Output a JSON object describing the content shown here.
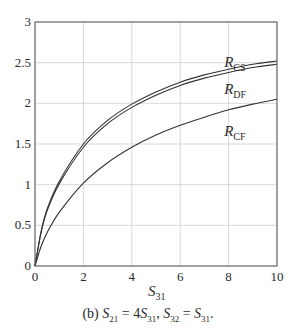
{
  "chart_data": {
    "type": "line",
    "title": "",
    "xlabel": "S31",
    "ylabel": "",
    "xlim": [
      0,
      10
    ],
    "ylim": [
      0,
      3
    ],
    "grid": true,
    "xticks": [
      0,
      2,
      4,
      6,
      8,
      10
    ],
    "yticks": [
      0,
      0.5,
      1,
      1.5,
      2,
      2.5,
      3
    ],
    "x": [
      0,
      0.25,
      0.5,
      1,
      2,
      3,
      4,
      5,
      6,
      7,
      8,
      9,
      10
    ],
    "series": [
      {
        "name": "R_CS",
        "label_main": "R",
        "label_sub": "CS",
        "values": [
          0,
          0.42,
          0.7,
          1.04,
          1.5,
          1.79,
          1.99,
          2.14,
          2.26,
          2.35,
          2.42,
          2.48,
          2.52
        ]
      },
      {
        "name": "R_DF",
        "label_main": "R",
        "label_sub": "DF",
        "values": [
          0,
          0.41,
          0.68,
          1.01,
          1.46,
          1.75,
          1.95,
          2.1,
          2.22,
          2.31,
          2.38,
          2.44,
          2.48
        ]
      },
      {
        "name": "R_CF",
        "label_main": "R",
        "label_sub": "CF",
        "values": [
          0,
          0.24,
          0.41,
          0.66,
          1.02,
          1.27,
          1.46,
          1.61,
          1.73,
          1.83,
          1.92,
          1.99,
          2.05
        ]
      }
    ],
    "annotations": [
      {
        "series": "R_CS",
        "x": 6.0,
        "y": 2.45
      },
      {
        "series": "R_DF",
        "x": 6.0,
        "y": 2.12
      },
      {
        "series": "R_CF",
        "x": 6.0,
        "y": 1.6
      }
    ]
  },
  "axis": {
    "xlabel_main": "S",
    "xlabel_sub": "31"
  },
  "caption": {
    "text": "(b) S21 = 4S31, S32 = S31."
  }
}
